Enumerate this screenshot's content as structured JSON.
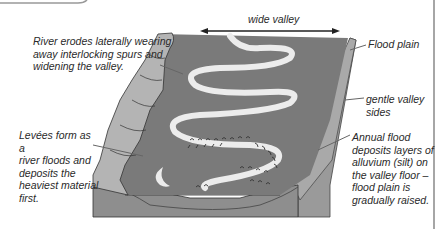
{
  "diagram": {
    "labels": {
      "river_erodes": "River erodes laterally wearing\naway interlocking spurs and\nwidening the valley.",
      "wide_valley": "wide valley",
      "flood_plain": "Flood plain",
      "gentle_sides": "gentle valley\nsides",
      "levees": "Levées form as a\nriver floods and\ndeposits the\nheaviest material\nfirst.",
      "annual_flood": "Annual flood\ndeposits layers of\nalluvium (silt) on\nthe valley floor –\nflood plain is\ngradually raised."
    },
    "colors": {
      "valley_floor": "#7a7a7a",
      "valley_sides": "#b4b4b4",
      "front_face": "#8e8e8e",
      "river": "#eeeeee",
      "outline": "#333333",
      "text": "#2a2a2a",
      "border": "#888888"
    }
  }
}
